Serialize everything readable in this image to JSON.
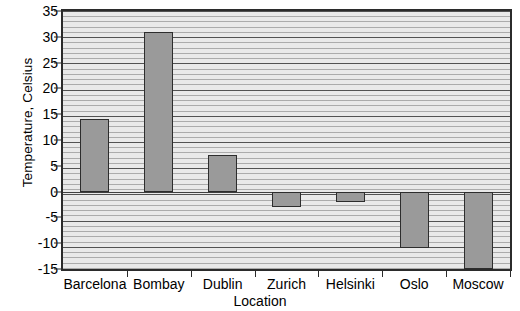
{
  "chart_data": {
    "type": "bar",
    "title": "",
    "xlabel": "Location",
    "ylabel": "Temperature, Celsius",
    "categories": [
      "Barcelona",
      "Bombay",
      "Dublin",
      "Zurich",
      "Helsinki",
      "Oslo",
      "Moscow"
    ],
    "values": [
      14,
      31,
      7,
      -3,
      -2,
      -11,
      0
    ],
    "ylim": [
      -15,
      35
    ],
    "ytick_labels": [
      "35",
      "30",
      "25",
      "20",
      "15",
      "10",
      "5",
      "0",
      "-5",
      "-10",
      "-15"
    ],
    "ytick_values": [
      35,
      30,
      25,
      20,
      15,
      10,
      5,
      0,
      -5,
      -10,
      -15
    ],
    "major_tick_step": 5,
    "minor_tick_step": 1,
    "grid": "horizontal",
    "legend": "none",
    "bar_color": "#9a9a9a",
    "bar_edge_color": "#2d2d2d",
    "plot_background": "#e9e9e9",
    "axis_color": "#2b2b2b"
  }
}
